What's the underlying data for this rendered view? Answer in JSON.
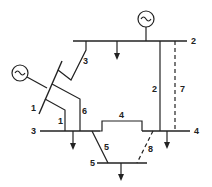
{
  "diagram": {
    "type": "power-system-one-line-diagram",
    "colors": {
      "stroke": "#222222",
      "background": "#ffffff"
    },
    "buses": [
      {
        "id": "1",
        "label": "1"
      },
      {
        "id": "2",
        "label": "2"
      },
      {
        "id": "3",
        "label": "3"
      },
      {
        "id": "4",
        "label": "4"
      },
      {
        "id": "5",
        "label": "5"
      }
    ],
    "lines": [
      {
        "id": "1",
        "label": "1",
        "style": "solid"
      },
      {
        "id": "2",
        "label": "2",
        "style": "solid"
      },
      {
        "id": "3",
        "label": "3",
        "style": "solid"
      },
      {
        "id": "4",
        "label": "4",
        "style": "solid"
      },
      {
        "id": "5",
        "label": "5",
        "style": "solid"
      },
      {
        "id": "6",
        "label": "6",
        "style": "solid"
      },
      {
        "id": "7",
        "label": "7",
        "style": "dashed"
      },
      {
        "id": "8",
        "label": "8",
        "style": "dashed"
      }
    ],
    "generators": [
      {
        "bus": "1",
        "symbol": "~"
      },
      {
        "bus": "2",
        "symbol": "~"
      }
    ],
    "loads": [
      {
        "bus": "2"
      },
      {
        "bus": "3"
      },
      {
        "bus": "4"
      },
      {
        "bus": "5"
      }
    ]
  }
}
